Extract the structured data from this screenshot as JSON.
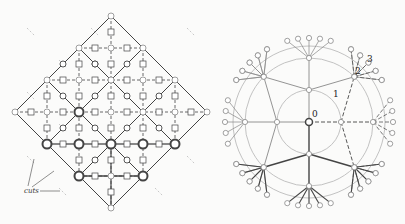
{
  "colors": {
    "background": "#fbfbfa",
    "line_dark": "#444444",
    "line_mid": "#888888",
    "line_light": "#bbbbbb",
    "node_fill": "#ffffff"
  },
  "left_diagram": {
    "title": "diamond-lattice",
    "center": [
      111,
      112
    ],
    "half_size": 96,
    "spacing": 32,
    "cuts_label": "cuts",
    "cuts_label_pos": [
      24,
      193
    ]
  },
  "right_diagram": {
    "title": "radial-tree",
    "center": [
      309,
      122
    ],
    "ring_radii": [
      32,
      64,
      76
    ],
    "outer_node_radius": 84,
    "labels": [
      {
        "text": "0",
        "x": 312,
        "y": 117
      },
      {
        "text": "1",
        "x": 333,
        "y": 97
      },
      {
        "text": "2",
        "x": 355,
        "y": 74
      },
      {
        "text": "3",
        "x": 367,
        "y": 62
      }
    ]
  }
}
